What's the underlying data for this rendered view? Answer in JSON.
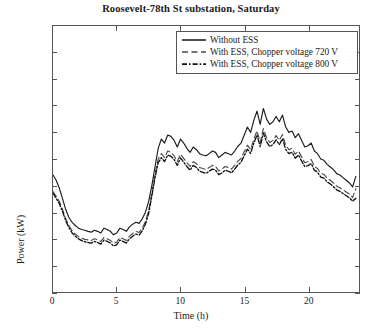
{
  "chart_data": {
    "type": "line",
    "title": "Roosevelt-78th St substation, Saturday",
    "xlabel": "Time (h)",
    "ylabel": "Power (kW)",
    "xlim": [
      0,
      24
    ],
    "ylim": [
      0,
      1000
    ],
    "xticks": [
      0,
      5,
      10,
      15,
      20
    ],
    "yticks": [
      0,
      100,
      200,
      300,
      400,
      500,
      600,
      700,
      800,
      900,
      1000
    ],
    "grid": false,
    "legend_position": "top-right",
    "x": [
      0,
      0.25,
      0.5,
      0.75,
      1,
      1.25,
      1.5,
      1.75,
      2,
      2.25,
      2.5,
      2.75,
      3,
      3.25,
      3.5,
      3.75,
      4,
      4.25,
      4.5,
      4.75,
      5,
      5.25,
      5.5,
      5.75,
      6,
      6.25,
      6.5,
      6.75,
      7,
      7.25,
      7.5,
      7.75,
      8,
      8.25,
      8.5,
      8.75,
      9,
      9.25,
      9.5,
      9.75,
      10,
      10.25,
      10.5,
      10.75,
      11,
      11.25,
      11.5,
      11.75,
      12,
      12.25,
      12.5,
      12.75,
      13,
      13.25,
      13.5,
      13.75,
      14,
      14.25,
      14.5,
      14.75,
      15,
      15.25,
      15.5,
      15.75,
      16,
      16.25,
      16.5,
      16.75,
      17,
      17.25,
      17.5,
      17.75,
      18,
      18.25,
      18.5,
      18.75,
      19,
      19.25,
      19.5,
      19.75,
      20,
      20.25,
      20.5,
      20.75,
      21,
      21.25,
      21.5,
      21.75,
      22,
      22.25,
      22.5,
      22.75,
      23,
      23.25,
      23.5,
      23.75
    ],
    "series": [
      {
        "name": "Without ESS",
        "style": "solid",
        "color": "#1a1a1a",
        "values": [
          440,
          420,
          390,
          350,
          310,
          280,
          262,
          250,
          240,
          235,
          232,
          228,
          225,
          232,
          228,
          222,
          240,
          235,
          228,
          215,
          222,
          240,
          235,
          228,
          245,
          255,
          262,
          258,
          275,
          300,
          340,
          400,
          470,
          540,
          575,
          560,
          590,
          585,
          570,
          545,
          575,
          560,
          540,
          525,
          545,
          535,
          520,
          515,
          512,
          520,
          530,
          525,
          505,
          515,
          525,
          520,
          515,
          530,
          548,
          560,
          590,
          620,
          600,
          645,
          680,
          630,
          690,
          650,
          630,
          640,
          660,
          640,
          665,
          620,
          600,
          605,
          580,
          595,
          570,
          545,
          550,
          560,
          530,
          520,
          500,
          495,
          480,
          470,
          460,
          445,
          440,
          430,
          420,
          410,
          395,
          435
        ]
      },
      {
        "name": "With ESS, Chopper voltage 720 V",
        "style": "dashed",
        "color": "#4a4a4a",
        "values": [
          378,
          360,
          340,
          310,
          275,
          250,
          230,
          218,
          208,
          202,
          198,
          196,
          194,
          200,
          196,
          190,
          205,
          200,
          194,
          183,
          188,
          205,
          200,
          194,
          210,
          220,
          228,
          224,
          240,
          265,
          305,
          370,
          442,
          500,
          520,
          505,
          530,
          525,
          512,
          490,
          518,
          502,
          486,
          472,
          490,
          482,
          468,
          464,
          460,
          468,
          476,
          472,
          455,
          462,
          472,
          468,
          462,
          476,
          492,
          502,
          528,
          552,
          536,
          575,
          606,
          562,
          614,
          580,
          562,
          570,
          588,
          570,
          592,
          552,
          535,
          540,
          518,
          530,
          508,
          486,
          490,
          498,
          472,
          464,
          446,
          442,
          428,
          420,
          410,
          398,
          392,
          384,
          376,
          368,
          355,
          388
        ]
      },
      {
        "name": "With ESS, Chopper voltage 800 V",
        "style": "dashdot",
        "color": "#111111",
        "values": [
          372,
          352,
          332,
          302,
          268,
          242,
          222,
          210,
          200,
          193,
          189,
          186,
          184,
          190,
          186,
          180,
          195,
          190,
          184,
          173,
          178,
          195,
          190,
          184,
          200,
          210,
          218,
          214,
          230,
          255,
          295,
          360,
          430,
          486,
          505,
          490,
          515,
          510,
          498,
          476,
          504,
          488,
          472,
          458,
          476,
          468,
          454,
          450,
          446,
          454,
          462,
          458,
          441,
          448,
          458,
          454,
          448,
          462,
          478,
          488,
          513,
          537,
          521,
          560,
          590,
          547,
          598,
          564,
          547,
          554,
          572,
          554,
          576,
          536,
          520,
          525,
          503,
          515,
          493,
          471,
          475,
          483,
          458,
          450,
          432,
          428,
          414,
          406,
          396,
          384,
          378,
          370,
          362,
          354,
          342,
          352
        ]
      }
    ]
  },
  "title": "Roosevelt-78th St substation, Saturday",
  "axes": {
    "ylabel": "Power (kW)",
    "xlabel": "Time (h)",
    "yticks": [
      "1000",
      "900",
      "800",
      "700",
      "600",
      "500",
      "400",
      "300",
      "200",
      "100",
      "0"
    ],
    "xticks": [
      "0",
      "5",
      "10",
      "15",
      "20"
    ]
  },
  "legend": {
    "items": [
      {
        "label": "Without ESS",
        "style": "solid"
      },
      {
        "label": "With ESS, Chopper voltage 720 V",
        "style": "dashed"
      },
      {
        "label": "With ESS, Chopper voltage 800 V",
        "style": "dashdot"
      }
    ]
  }
}
